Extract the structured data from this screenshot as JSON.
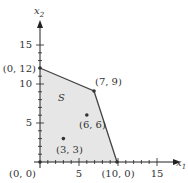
{
  "diagram": {
    "type": "feasible-region",
    "region_label": "S",
    "colors": {
      "axis": "#222222",
      "boundary": "#444444",
      "fill": "#e6e6e6",
      "text": "#333333"
    },
    "axes": {
      "x_label": "x",
      "x_sub": "1",
      "y_label": "x",
      "y_sub": "2",
      "x_ticks": [
        "5",
        "10",
        "15"
      ],
      "y_ticks": [
        "5",
        "10",
        "15"
      ]
    },
    "vertices": [
      {
        "label": "(0, 0)",
        "x": 0,
        "y": 0
      },
      {
        "label": "(0, 12)",
        "x": 0,
        "y": 12
      },
      {
        "label": "(7, 9)",
        "x": 7,
        "y": 9
      },
      {
        "label": "(10, 0)",
        "x": 10,
        "y": 0
      }
    ],
    "interior_points": [
      {
        "label": "(6, 6)",
        "x": 6,
        "y": 6
      },
      {
        "label": "(3, 3)",
        "x": 3,
        "y": 3
      }
    ]
  }
}
